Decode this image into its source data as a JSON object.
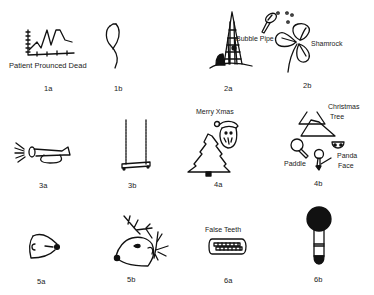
{
  "figure": {
    "panels": [
      {
        "id": "1a",
        "number": "1a",
        "captions": [
          "Patient Prounced Dead"
        ],
        "depicts": "line-chart-drawing"
      },
      {
        "id": "1b",
        "number": "1b",
        "captions": [],
        "depicts": "stethoscope-drawing"
      },
      {
        "id": "2a",
        "number": "2a",
        "captions": [],
        "depicts": "tower-drawing"
      },
      {
        "id": "2b",
        "number": "2b",
        "captions": [
          "Bubble Pipe",
          "Shamrock"
        ],
        "depicts": "bubble-pipe-and-shamrock-drawing"
      },
      {
        "id": "3a",
        "number": "3a",
        "captions": [],
        "depicts": "horn-drawing"
      },
      {
        "id": "3b",
        "number": "3b",
        "captions": [],
        "depicts": "swing-drawing"
      },
      {
        "id": "4a",
        "number": "4a",
        "captions": [
          "Merry Xmas"
        ],
        "depicts": "santa-and-tree-drawing"
      },
      {
        "id": "4b",
        "number": "4b",
        "captions": [
          "Christmas Tree",
          "Paddle",
          "Panda Face"
        ],
        "depicts": "tree-paddle-panda-drawing"
      },
      {
        "id": "5a",
        "number": "5a",
        "captions": [],
        "depicts": "mouse-head-drawing"
      },
      {
        "id": "5b",
        "number": "5b",
        "captions": [],
        "depicts": "reindeer-head-drawing"
      },
      {
        "id": "6a",
        "number": "6a",
        "captions": [
          "False Teeth"
        ],
        "depicts": "false-teeth-drawing"
      },
      {
        "id": "6b",
        "number": "6b",
        "captions": [],
        "depicts": "brush-drawing"
      }
    ],
    "labels": {
      "p1a_caption": "Patient Prounced Dead",
      "p2b_caption_pipe": "Bubble Pipe",
      "p2b_caption_shamrock": "Shamrock",
      "p4a_caption": "Merry Xmas",
      "p4b_caption_tree_1": "Christmas",
      "p4b_caption_tree_2": "Tree",
      "p4b_caption_paddle": "Paddle",
      "p4b_caption_panda_1": "Panda",
      "p4b_caption_panda_2": "Face",
      "p6a_caption": "False Teeth"
    },
    "numbers": {
      "n1a": "1a",
      "n1b": "1b",
      "n2a": "2a",
      "n2b": "2b",
      "n3a": "3a",
      "n3b": "3b",
      "n4a": "4a",
      "n4b": "4b",
      "n5a": "5a",
      "n5b": "5b",
      "n6a": "6a",
      "n6b": "6b"
    }
  }
}
